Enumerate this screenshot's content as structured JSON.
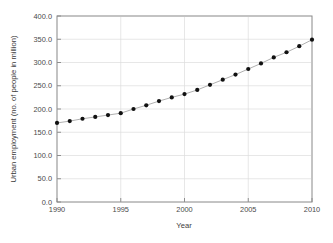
{
  "chart_data": {
    "type": "line",
    "title": "",
    "subtitle": "",
    "xlabel": "Year",
    "ylabel": "Urban employment (no. of people in million)",
    "xlim": [
      1990,
      2010
    ],
    "ylim": [
      0,
      400
    ],
    "xticks": [
      1990,
      1995,
      2000,
      2005,
      2010
    ],
    "xtick_labels": [
      "1990",
      "1995",
      "2000",
      "2005",
      "2010"
    ],
    "yticks": [
      0,
      50,
      100,
      150,
      200,
      250,
      300,
      350,
      400
    ],
    "ytick_labels": [
      "0.0",
      "50.0",
      "100.0",
      "150.0",
      "200.0",
      "250.0",
      "300.0",
      "350.0",
      "400.0"
    ],
    "grid": true,
    "grid_color": "#dcdcdc",
    "legend": null,
    "legend_position": "none",
    "marker": "filled-circle",
    "marker_color": "#111111",
    "line_color": "#9a9a9a",
    "x": [
      1990,
      1991,
      1992,
      1993,
      1994,
      1995,
      1996,
      1997,
      1998,
      1999,
      2000,
      2001,
      2002,
      2003,
      2004,
      2005,
      2006,
      2007,
      2008,
      2009,
      2010
    ],
    "values": [
      170,
      174,
      179,
      183,
      187,
      191,
      200,
      208,
      217,
      225,
      232,
      241,
      252,
      263,
      274,
      286,
      298,
      311,
      322,
      335,
      349
    ],
    "series": [
      {
        "name": "Urban employment",
        "values": [
          170,
          174,
          179,
          183,
          187,
          191,
          200,
          208,
          217,
          225,
          232,
          241,
          252,
          263,
          274,
          286,
          298,
          311,
          322,
          335,
          349
        ]
      }
    ]
  },
  "figure": {
    "background": "#ffffff",
    "plot_left": 57,
    "plot_right": 312,
    "plot_top": 16,
    "plot_bottom": 202
  }
}
